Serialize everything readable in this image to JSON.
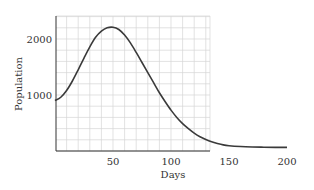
{
  "chart_data": {
    "type": "line",
    "title": "",
    "xlabel": "Days",
    "ylabel": "Population",
    "xlim": [
      0,
      205
    ],
    "ylim": [
      0,
      2400
    ],
    "x_ticks": [
      50,
      100,
      150,
      200
    ],
    "y_ticks": [
      1000,
      2000
    ],
    "grid": true,
    "grid_x_step": 10,
    "grid_y_step": 200,
    "legend": null,
    "series": [
      {
        "name": "Population",
        "x": [
          0,
          5,
          10,
          15,
          20,
          25,
          30,
          35,
          40,
          45,
          50,
          55,
          60,
          65,
          70,
          75,
          80,
          85,
          90,
          95,
          100,
          105,
          110,
          115,
          120,
          125,
          130,
          135,
          140,
          145,
          150,
          160,
          170,
          180,
          190,
          200
        ],
        "y": [
          900,
          960,
          1080,
          1250,
          1450,
          1660,
          1860,
          2030,
          2140,
          2200,
          2210,
          2170,
          2070,
          1930,
          1760,
          1580,
          1400,
          1220,
          1040,
          880,
          730,
          600,
          490,
          400,
          320,
          255,
          205,
          165,
          135,
          110,
          95,
          80,
          72,
          68,
          65,
          64
        ]
      }
    ],
    "colors": {
      "line": "#3a3a3a",
      "grid": "#d6d6d6",
      "axis": "#333333"
    }
  }
}
